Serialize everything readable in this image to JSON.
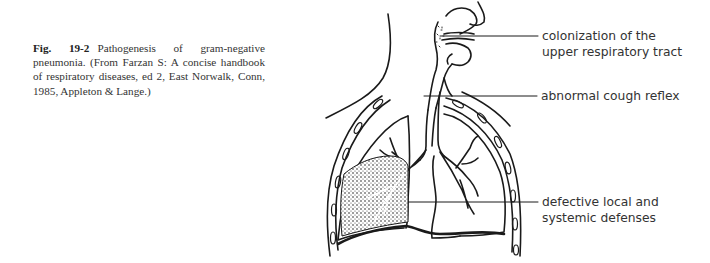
{
  "caption": {
    "figure_number": "Fig. 19-2",
    "text": "Pathogenesis of gram-negative pneumonia. (From Farzan S: A concise handbook of respiratory diseases, ed 2, East Norwalk, Conn, 1985, Appleton & Lange.)"
  },
  "diagram": {
    "labels": [
      {
        "line1": "colonization of the",
        "line2": "upper respiratory tract"
      },
      {
        "line1": "abnormal cough reflex"
      },
      {
        "line1": "defective local and",
        "line2": "systemic defenses"
      }
    ],
    "line_color": "#1a1a1a"
  }
}
